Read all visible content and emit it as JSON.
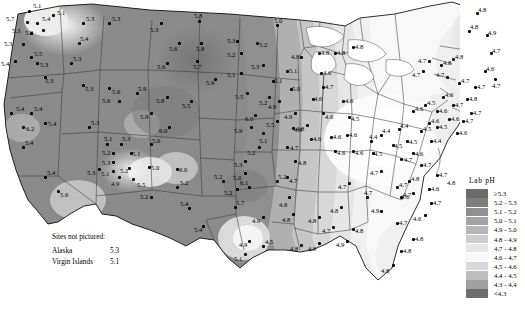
{
  "legend": {
    "title": "Lab pH",
    "entries": [
      {
        "label": "≥5.3",
        "color": "#6b6b6b"
      },
      {
        "label": "5.2 - 5.3",
        "color": "#7d7d7d"
      },
      {
        "label": "5.1 - 5.2",
        "color": "#8f8f8f"
      },
      {
        "label": "5.0 - 5.1",
        "color": "#a3a3a3"
      },
      {
        "label": "4.9 - 5.0",
        "color": "#b6b6b6"
      },
      {
        "label": "4.8 - 4.9",
        "color": "#cdcdcd"
      },
      {
        "label": "4.7 - 4.8",
        "color": "#e6e6e6"
      },
      {
        "label": "4.6 - 4.7",
        "color": "#f7f7f7"
      },
      {
        "label": "4.5 - 4.6",
        "color": "#d9d9d9"
      },
      {
        "label": "4.4 - 4.5",
        "color": "#bdbdbd"
      },
      {
        "label": "4.3 - 4.4",
        "color": "#a0a0a0"
      },
      {
        "label": "<4.3",
        "color": "#6e6e6e"
      }
    ]
  },
  "notes": {
    "title": "Sites not pictured:",
    "rows": [
      {
        "name": "Alaska",
        "value": "5.3"
      },
      {
        "name": "Virgin Islands",
        "value": "5.1"
      }
    ]
  },
  "legend_edge_label": "4.8",
  "chart_data": {
    "type": "map",
    "title": "Lab pH",
    "measure": "Laboratory pH",
    "region": "Continental United States",
    "legend_bins": [
      "≥5.3",
      "5.2 - 5.3",
      "5.1 - 5.2",
      "5.0 - 5.1",
      "4.9 - 5.0",
      "4.8 - 4.9",
      "4.7 - 4.8",
      "4.6 - 4.7",
      "4.5 - 4.6",
      "4.4 - 4.5",
      "4.3 - 4.4",
      "<4.3"
    ],
    "value_range": [
      4.2,
      6.2
    ],
    "unlabeled_sites": [
      {
        "name": "Alaska",
        "value": 5.3
      },
      {
        "name": "Virgin Islands",
        "value": 5.1
      }
    ],
    "sites": [
      {
        "x": 28,
        "y": 10,
        "v": "5.1",
        "lx": 5,
        "ly": -7
      },
      {
        "x": 26,
        "y": 21,
        "v": "5.7",
        "lx": -20,
        "ly": -5
      },
      {
        "x": 36,
        "y": 22,
        "v": "5.4",
        "lx": 6,
        "ly": -6
      },
      {
        "x": 52,
        "y": 14,
        "v": "5.1",
        "lx": 5,
        "ly": -4
      },
      {
        "x": 30,
        "y": 32,
        "v": "5.3",
        "lx": -18,
        "ly": -4
      },
      {
        "x": 42,
        "y": 29,
        "v": "5.2",
        "lx": -17,
        "ly": 1
      },
      {
        "x": 22,
        "y": 43,
        "v": "5.3",
        "lx": -18,
        "ly": -2
      },
      {
        "x": 30,
        "y": 56,
        "v": "5.5",
        "lx": 4,
        "ly": -5
      },
      {
        "x": 14,
        "y": 60,
        "v": "5.4",
        "lx": -13,
        "ly": 1
      },
      {
        "x": 36,
        "y": 62,
        "v": "5.3",
        "lx": 4,
        "ly": 0
      },
      {
        "x": 44,
        "y": 76,
        "v": "5.3",
        "lx": 1,
        "ly": 2
      },
      {
        "x": 82,
        "y": 22,
        "v": "5.3",
        "lx": 4,
        "ly": -6
      },
      {
        "x": 78,
        "y": 42,
        "v": "5.4",
        "lx": 2,
        "ly": -6
      },
      {
        "x": 70,
        "y": 62,
        "v": "5.3",
        "lx": 3,
        "ly": -6
      },
      {
        "x": 82,
        "y": 84,
        "v": "5.3",
        "lx": 3,
        "ly": 2
      },
      {
        "x": 108,
        "y": 22,
        "v": "5.3",
        "lx": 4,
        "ly": -6
      },
      {
        "x": 108,
        "y": 87,
        "v": "5.6",
        "lx": 4,
        "ly": 2
      },
      {
        "x": 10,
        "y": 112,
        "v": "5.4",
        "lx": 6,
        "ly": -6
      },
      {
        "x": 30,
        "y": 112,
        "v": "5.4",
        "lx": 4,
        "ly": -6
      },
      {
        "x": 22,
        "y": 126,
        "v": "6.2",
        "lx": 4,
        "ly": 0
      },
      {
        "x": 44,
        "y": 122,
        "v": "5.4",
        "lx": 4,
        "ly": -1
      },
      {
        "x": 22,
        "y": 146,
        "v": "5.4",
        "lx": 3,
        "ly": -6
      },
      {
        "x": 44,
        "y": 176,
        "v": "5.4",
        "lx": 3,
        "ly": -6
      },
      {
        "x": 57,
        "y": 190,
        "v": "5.6",
        "lx": 3,
        "ly": 2
      },
      {
        "x": 88,
        "y": 126,
        "v": "5.3",
        "lx": 3,
        "ly": -6
      },
      {
        "x": 118,
        "y": 100,
        "v": "5.6",
        "lx": -16,
        "ly": -2
      },
      {
        "x": 136,
        "y": 92,
        "v": "5.9",
        "lx": 2,
        "ly": -6
      },
      {
        "x": 106,
        "y": 143,
        "v": "5.1",
        "lx": -2,
        "ly": -7
      },
      {
        "x": 120,
        "y": 143,
        "v": "5.3",
        "lx": 2,
        "ly": -7
      },
      {
        "x": 112,
        "y": 152,
        "v": "5.2",
        "lx": -10,
        "ly": -2
      },
      {
        "x": 130,
        "y": 152,
        "v": "5.1",
        "lx": 2,
        "ly": -1
      },
      {
        "x": 112,
        "y": 161,
        "v": "5.3",
        "lx": -10,
        "ly": -1
      },
      {
        "x": 150,
        "y": 143,
        "v": "5.6",
        "lx": 2,
        "ly": -5
      },
      {
        "x": 98,
        "y": 168,
        "v": "5.3",
        "lx": -11,
        "ly": 2
      },
      {
        "x": 112,
        "y": 170,
        "v": "5.1",
        "lx": -11,
        "ly": 1
      },
      {
        "x": 128,
        "y": 167,
        "v": "5.2",
        "lx": -8,
        "ly": 1
      },
      {
        "x": 148,
        "y": 166,
        "v": "5.0",
        "lx": 3,
        "ly": -1
      },
      {
        "x": 118,
        "y": 176,
        "v": "4.9",
        "lx": -7,
        "ly": 5
      },
      {
        "x": 132,
        "y": 178,
        "v": "5.5",
        "lx": 5,
        "ly": 4
      },
      {
        "x": 176,
        "y": 168,
        "v": "6.0",
        "lx": 3,
        "ly": -1
      },
      {
        "x": 160,
        "y": 22,
        "v": "5.3",
        "lx": -10,
        "ly": 5
      },
      {
        "x": 198,
        "y": 20,
        "v": "5.8",
        "lx": -4,
        "ly": -7
      },
      {
        "x": 200,
        "y": 42,
        "v": "5.8",
        "lx": -4,
        "ly": 4
      },
      {
        "x": 178,
        "y": 42,
        "v": "5.6",
        "lx": -9,
        "ly": 4
      },
      {
        "x": 196,
        "y": 60,
        "v": "5.7",
        "lx": -3,
        "ly": 4
      },
      {
        "x": 166,
        "y": 62,
        "v": "5.6",
        "lx": -9,
        "ly": 2
      },
      {
        "x": 214,
        "y": 78,
        "v": "5.9",
        "lx": -8,
        "ly": 2
      },
      {
        "x": 190,
        "y": 100,
        "v": "5.5",
        "lx": -8,
        "ly": 3
      },
      {
        "x": 166,
        "y": 96,
        "v": "5.8",
        "lx": -10,
        "ly": 2
      },
      {
        "x": 150,
        "y": 112,
        "v": "5.9",
        "lx": -10,
        "ly": 2
      },
      {
        "x": 168,
        "y": 126,
        "v": "6.0",
        "lx": -9,
        "ly": 2
      },
      {
        "x": 150,
        "y": 196,
        "v": "5.2",
        "lx": -10,
        "ly": -2
      },
      {
        "x": 176,
        "y": 186,
        "v": "5.2",
        "lx": 4,
        "ly": -6
      },
      {
        "x": 188,
        "y": 207,
        "v": "5.4",
        "lx": -8,
        "ly": -6
      },
      {
        "x": 202,
        "y": 225,
        "v": "5.4",
        "lx": -8,
        "ly": 2
      },
      {
        "x": 222,
        "y": 180,
        "v": "5.2",
        "lx": -8,
        "ly": -6
      },
      {
        "x": 248,
        "y": 186,
        "v": "6.1",
        "lx": -8,
        "ly": -6
      },
      {
        "x": 276,
        "y": 180,
        "v": "5.2",
        "lx": 2,
        "ly": -6
      },
      {
        "x": 234,
        "y": 206,
        "v": "5.7",
        "lx": 2,
        "ly": -6
      },
      {
        "x": 236,
        "y": 40,
        "v": "5.3",
        "lx": -9,
        "ly": -2
      },
      {
        "x": 240,
        "y": 52,
        "v": "5.2",
        "lx": -13,
        "ly": 0
      },
      {
        "x": 256,
        "y": 42,
        "v": "5.2",
        "lx": 3,
        "ly": 0
      },
      {
        "x": 276,
        "y": 24,
        "v": "5.0",
        "lx": -2,
        "ly": -6
      },
      {
        "x": 240,
        "y": 72,
        "v": "5.1",
        "lx": -13,
        "ly": 0
      },
      {
        "x": 262,
        "y": 64,
        "v": "5.3",
        "lx": -11,
        "ly": 0
      },
      {
        "x": 246,
        "y": 92,
        "v": "5.5",
        "lx": -11,
        "ly": 2
      },
      {
        "x": 272,
        "y": 80,
        "v": "5.1",
        "lx": 2,
        "ly": -2
      },
      {
        "x": 268,
        "y": 96,
        "v": "5.2",
        "lx": -9,
        "ly": 4
      },
      {
        "x": 254,
        "y": 114,
        "v": "6.0",
        "lx": -9,
        "ly": 2
      },
      {
        "x": 250,
        "y": 126,
        "v": "5.9",
        "lx": -16,
        "ly": 2
      },
      {
        "x": 276,
        "y": 120,
        "v": "5.5",
        "lx": -10,
        "ly": 2
      },
      {
        "x": 262,
        "y": 132,
        "v": "5.1",
        "lx": -3,
        "ly": 6
      },
      {
        "x": 258,
        "y": 146,
        "v": "5.2",
        "lx": -11,
        "ly": 4
      },
      {
        "x": 244,
        "y": 160,
        "v": "5.3",
        "lx": -10,
        "ly": 2
      },
      {
        "x": 244,
        "y": 172,
        "v": "5.0",
        "lx": -11,
        "ly": 3
      },
      {
        "x": 236,
        "y": 188,
        "v": "5.2",
        "lx": -12,
        "ly": 2
      },
      {
        "x": 278,
        "y": 100,
        "v": "4.9",
        "lx": -10,
        "ly": 4
      },
      {
        "x": 290,
        "y": 88,
        "v": "5.0",
        "lx": 2,
        "ly": -2
      },
      {
        "x": 286,
        "y": 70,
        "v": "5.1",
        "lx": 3,
        "ly": -2
      },
      {
        "x": 294,
        "y": 112,
        "v": "4.9",
        "lx": -10,
        "ly": 2
      },
      {
        "x": 292,
        "y": 127,
        "v": "4.8",
        "lx": 2,
        "ly": 0
      },
      {
        "x": 286,
        "y": 146,
        "v": "4.7",
        "lx": 4,
        "ly": -1
      },
      {
        "x": 294,
        "y": 160,
        "v": "4.8",
        "lx": 4,
        "ly": 0
      },
      {
        "x": 286,
        "y": 176,
        "v": "4.7",
        "lx": 3,
        "ly": 2
      },
      {
        "x": 288,
        "y": 196,
        "v": "4.8",
        "lx": -9,
        "ly": 6
      },
      {
        "x": 292,
        "y": 213,
        "v": "4.8",
        "lx": -10,
        "ly": 4
      },
      {
        "x": 262,
        "y": 216,
        "v": "4.9",
        "lx": -10,
        "ly": 2
      },
      {
        "x": 248,
        "y": 240,
        "v": "4.9",
        "lx": -9,
        "ly": 2
      },
      {
        "x": 244,
        "y": 253,
        "v": "5.1",
        "lx": -10,
        "ly": 3
      },
      {
        "x": 262,
        "y": 245,
        "v": "4.5",
        "lx": 3,
        "ly": -6
      },
      {
        "x": 300,
        "y": 56,
        "v": "4.8",
        "lx": -9,
        "ly": -2
      },
      {
        "x": 318,
        "y": 52,
        "v": "4.8",
        "lx": 3,
        "ly": -2
      },
      {
        "x": 334,
        "y": 52,
        "v": "4.8",
        "lx": 3,
        "ly": -2
      },
      {
        "x": 352,
        "y": 46,
        "v": "4.8",
        "lx": 3,
        "ly": -2
      },
      {
        "x": 320,
        "y": 72,
        "v": "4.6",
        "lx": 3,
        "ly": -2
      },
      {
        "x": 322,
        "y": 86,
        "v": "4.7",
        "lx": 3,
        "ly": -2
      },
      {
        "x": 312,
        "y": 98,
        "v": "4.6",
        "lx": 2,
        "ly": -2
      },
      {
        "x": 322,
        "y": 112,
        "v": "4.6",
        "lx": 3,
        "ly": 2
      },
      {
        "x": 342,
        "y": 100,
        "v": "4.6",
        "lx": 3,
        "ly": -2
      },
      {
        "x": 348,
        "y": 116,
        "v": "4.5",
        "lx": 3,
        "ly": 0
      },
      {
        "x": 306,
        "y": 124,
        "v": "4.8",
        "lx": -10,
        "ly": 2
      },
      {
        "x": 310,
        "y": 138,
        "v": "4.6",
        "lx": 3,
        "ly": -2
      },
      {
        "x": 330,
        "y": 136,
        "v": "4.6",
        "lx": 3,
        "ly": -2
      },
      {
        "x": 346,
        "y": 134,
        "v": "4.6",
        "lx": 3,
        "ly": -2
      },
      {
        "x": 334,
        "y": 150,
        "v": "4.6",
        "lx": 3,
        "ly": 0
      },
      {
        "x": 352,
        "y": 150,
        "v": "4.6",
        "lx": 3,
        "ly": 0
      },
      {
        "x": 370,
        "y": 140,
        "v": "4.4",
        "lx": -1,
        "ly": -6
      },
      {
        "x": 372,
        "y": 152,
        "v": "4.5",
        "lx": 2,
        "ly": -1
      },
      {
        "x": 380,
        "y": 134,
        "v": "4.4",
        "lx": 2,
        "ly": -6
      },
      {
        "x": 392,
        "y": 144,
        "v": "4.5",
        "lx": 2,
        "ly": -1
      },
      {
        "x": 398,
        "y": 128,
        "v": "4.4",
        "lx": 2,
        "ly": -5
      },
      {
        "x": 406,
        "y": 140,
        "v": "4.5",
        "lx": 3,
        "ly": -1
      },
      {
        "x": 412,
        "y": 152,
        "v": "4.6",
        "lx": 3,
        "ly": -1
      },
      {
        "x": 400,
        "y": 158,
        "v": "4.7",
        "lx": 4,
        "ly": -1
      },
      {
        "x": 420,
        "y": 130,
        "v": "4.5",
        "lx": 3,
        "ly": -4
      },
      {
        "x": 430,
        "y": 140,
        "v": "4.4",
        "lx": 3,
        "ly": -2
      },
      {
        "x": 428,
        "y": 122,
        "v": "4.6",
        "lx": 3,
        "ly": -4
      },
      {
        "x": 412,
        "y": 110,
        "v": "4.6",
        "lx": 3,
        "ly": -4
      },
      {
        "x": 424,
        "y": 104,
        "v": "4.5",
        "lx": 3,
        "ly": -4
      },
      {
        "x": 436,
        "y": 110,
        "v": "4.6",
        "lx": 3,
        "ly": -2
      },
      {
        "x": 442,
        "y": 96,
        "v": "4.6",
        "lx": 3,
        "ly": -4
      },
      {
        "x": 452,
        "y": 104,
        "v": "4.7",
        "lx": 3,
        "ly": -2
      },
      {
        "x": 448,
        "y": 118,
        "v": "4.6",
        "lx": 3,
        "ly": -2
      },
      {
        "x": 436,
        "y": 126,
        "v": "4.5",
        "lx": 3,
        "ly": -2
      },
      {
        "x": 456,
        "y": 132,
        "v": "4.6",
        "lx": 3,
        "ly": -2
      },
      {
        "x": 462,
        "y": 120,
        "v": "4.7",
        "lx": 3,
        "ly": -2
      },
      {
        "x": 470,
        "y": 112,
        "v": "4.7",
        "lx": 3,
        "ly": -2
      },
      {
        "x": 466,
        "y": 98,
        "v": "4.8",
        "lx": 3,
        "ly": -2
      },
      {
        "x": 474,
        "y": 86,
        "v": "4.7",
        "lx": 3,
        "ly": -2
      },
      {
        "x": 458,
        "y": 82,
        "v": "4.7",
        "lx": 3,
        "ly": -4
      },
      {
        "x": 446,
        "y": 76,
        "v": "4.7",
        "lx": -10,
        "ly": -4
      },
      {
        "x": 440,
        "y": 64,
        "v": "4.8",
        "lx": 3,
        "ly": -4
      },
      {
        "x": 428,
        "y": 60,
        "v": "4.7",
        "lx": -10,
        "ly": -2
      },
      {
        "x": 422,
        "y": 70,
        "v": "4.7",
        "lx": -10,
        "ly": 2
      },
      {
        "x": 452,
        "y": 58,
        "v": "4.8",
        "lx": 3,
        "ly": -4
      },
      {
        "x": 468,
        "y": 30,
        "v": "4.8",
        "lx": 2,
        "ly": -6
      },
      {
        "x": 476,
        "y": 12,
        "v": "4.8",
        "lx": 2,
        "ly": -5
      },
      {
        "x": 486,
        "y": 34,
        "v": "4.9",
        "lx": 2,
        "ly": -4
      },
      {
        "x": 490,
        "y": 52,
        "v": "4.7",
        "lx": 2,
        "ly": -4
      },
      {
        "x": 484,
        "y": 70,
        "v": "4.6",
        "lx": 2,
        "ly": -4
      },
      {
        "x": 494,
        "y": 78,
        "v": "4.7",
        "lx": -2,
        "ly": 5
      },
      {
        "x": 380,
        "y": 170,
        "v": "4.7",
        "lx": -10,
        "ly": 0
      },
      {
        "x": 348,
        "y": 182,
        "v": "4.7",
        "lx": -10,
        "ly": 2
      },
      {
        "x": 366,
        "y": 196,
        "v": "4.7",
        "lx": -2,
        "ly": -6
      },
      {
        "x": 340,
        "y": 206,
        "v": "4.8",
        "lx": -10,
        "ly": 2
      },
      {
        "x": 318,
        "y": 216,
        "v": "4.8",
        "lx": -10,
        "ly": 2
      },
      {
        "x": 332,
        "y": 226,
        "v": "4.7",
        "lx": -10,
        "ly": 2
      },
      {
        "x": 352,
        "y": 228,
        "v": "4.8",
        "lx": 3,
        "ly": 0
      },
      {
        "x": 346,
        "y": 240,
        "v": "4.9",
        "lx": -10,
        "ly": 2
      },
      {
        "x": 318,
        "y": 242,
        "v": "4.8",
        "lx": -10,
        "ly": 4
      },
      {
        "x": 300,
        "y": 244,
        "v": "4.8",
        "lx": -10,
        "ly": 2
      },
      {
        "x": 380,
        "y": 210,
        "v": "4.9",
        "lx": -9,
        "ly": -2
      },
      {
        "x": 396,
        "y": 222,
        "v": "4.7",
        "lx": 3,
        "ly": -2
      },
      {
        "x": 400,
        "y": 196,
        "v": "4.7",
        "lx": 3,
        "ly": -4
      },
      {
        "x": 396,
        "y": 186,
        "v": "4.7",
        "lx": 3,
        "ly": -4
      },
      {
        "x": 408,
        "y": 180,
        "v": "4.8",
        "lx": 3,
        "ly": -4
      },
      {
        "x": 412,
        "y": 192,
        "v": "4.6",
        "lx": -11,
        "ly": 2
      },
      {
        "x": 400,
        "y": 250,
        "v": "4.8",
        "lx": 3,
        "ly": -2
      },
      {
        "x": 392,
        "y": 264,
        "v": "4.8",
        "lx": -11,
        "ly": 4
      },
      {
        "x": 412,
        "y": 238,
        "v": "4.8",
        "lx": 3,
        "ly": -2
      },
      {
        "x": 424,
        "y": 214,
        "v": "4.6",
        "lx": -11,
        "ly": 2
      },
      {
        "x": 430,
        "y": 202,
        "v": "4.7",
        "lx": 3,
        "ly": -2
      },
      {
        "x": 428,
        "y": 188,
        "v": "4.6",
        "lx": 3,
        "ly": -2
      },
      {
        "x": 436,
        "y": 174,
        "v": "4.7",
        "lx": 3,
        "ly": -2
      },
      {
        "x": 420,
        "y": 164,
        "v": "4.7",
        "lx": 3,
        "ly": -2
      }
    ]
  }
}
